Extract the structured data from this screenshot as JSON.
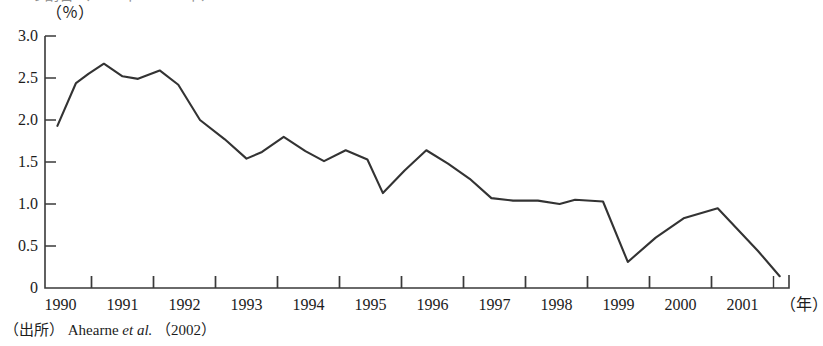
{
  "figure": {
    "top_clipped_caption": "の割合（1990年〜2001年）",
    "unit_label": "（％）",
    "xaxis_unit": "（年）",
    "source_prefix": "（出所）",
    "source_author": "Ahearne ",
    "source_italic": "et al.",
    "source_year": "（2002）",
    "line_color": "#333333",
    "axis_color": "#3a3a3a"
  },
  "chart_data": {
    "type": "line",
    "title": "",
    "subtitle": "",
    "xlabel": "年",
    "ylabel": "％",
    "ylim": [
      0,
      3.0
    ],
    "xlim": [
      1989.75,
      2001.75
    ],
    "grid": false,
    "legend": "none",
    "ytick_labels": [
      "0",
      "0.5",
      "1.0",
      "1.5",
      "2.0",
      "2.5",
      "3.0"
    ],
    "ytick_values": [
      0,
      0.5,
      1.0,
      1.5,
      2.0,
      2.5,
      3.0
    ],
    "xtick_labels": [
      "1990",
      "1991",
      "1992",
      "1993",
      "1994",
      "1995",
      "1996",
      "1997",
      "1998",
      "1999",
      "2000",
      "2001"
    ],
    "xtick_values": [
      1990,
      1991,
      1992,
      1993,
      1994,
      1995,
      1996,
      1997,
      1998,
      1999,
      2000,
      2001
    ],
    "series": [
      {
        "name": "比率",
        "x": [
          1989.95,
          1990.25,
          1990.45,
          1990.7,
          1991.0,
          1991.25,
          1991.6,
          1991.9,
          1992.25,
          1992.65,
          1993.0,
          1993.25,
          1993.6,
          1993.95,
          1994.25,
          1994.6,
          1994.95,
          1995.2,
          1995.55,
          1995.9,
          1996.25,
          1996.6,
          1996.95,
          1997.3,
          1997.7,
          1998.05,
          1998.3,
          1998.75,
          1999.15,
          1999.6,
          2000.05,
          2000.6,
          2001.25,
          2001.6
        ],
        "values": [
          1.93,
          2.44,
          2.55,
          2.67,
          2.52,
          2.49,
          2.59,
          2.42,
          2.0,
          1.77,
          1.54,
          1.62,
          1.8,
          1.63,
          1.51,
          1.64,
          1.53,
          1.13,
          1.4,
          1.64,
          1.48,
          1.3,
          1.07,
          1.04,
          1.04,
          1.0,
          1.05,
          1.03,
          0.31,
          0.6,
          0.83,
          0.95,
          0.44,
          0.14
        ]
      }
    ]
  }
}
